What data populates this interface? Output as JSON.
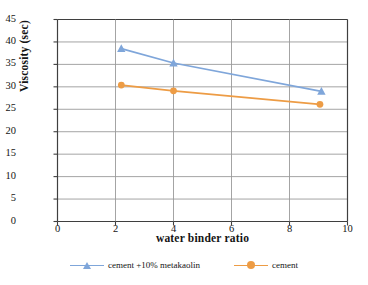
{
  "chart_data": {
    "type": "line",
    "title": "",
    "xlabel": "water binder ratio",
    "ylabel": "Viscosity (sec)",
    "xlim": [
      0,
      10
    ],
    "ylim": [
      0,
      45
    ],
    "xticks": [
      "0",
      "2",
      "4",
      "6",
      "8",
      "10"
    ],
    "yticks": [
      "0",
      "5",
      "10",
      "15",
      "20",
      "25",
      "30",
      "35",
      "40",
      "45"
    ],
    "grid": "both",
    "legend_position": "bottom",
    "series": [
      {
        "name": "cement +10% metakaolin",
        "color": "#7fa6da",
        "marker": "triangle",
        "x": [
          2.2,
          4.0,
          9.1
        ],
        "values": [
          38.5,
          35.3,
          29.0
        ]
      },
      {
        "name": "cement",
        "color": "#ed9c45",
        "marker": "circle",
        "x": [
          2.2,
          4.0,
          9.05
        ],
        "values": [
          30.4,
          29.1,
          26.1
        ]
      }
    ]
  },
  "colors": {
    "series_blue": "#7fa6da",
    "series_orange": "#ed9c45",
    "grid": "#9a9a9a",
    "axis": "#3f3f3f",
    "text": "#141414"
  }
}
